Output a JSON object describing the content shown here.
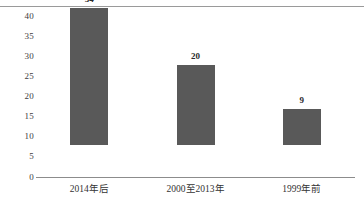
{
  "chart_data": {
    "type": "bar",
    "title": "",
    "subtitle": "",
    "xlabel": "",
    "ylabel": "",
    "categories": [
      "2014年后",
      "2000至2013年",
      "1999年前"
    ],
    "values": [
      34,
      20,
      9
    ],
    "series": [
      {
        "name": "",
        "values": [
          34,
          20,
          9
        ]
      }
    ],
    "ylim": [
      0,
      40
    ],
    "yticks": [
      0,
      5,
      10,
      15,
      20,
      25,
      30,
      35,
      40
    ],
    "ytick_labels": [
      "0",
      "5",
      "10",
      "15",
      "20",
      "25",
      "30",
      "35",
      "40"
    ],
    "grid": false,
    "legend": false,
    "legend_position": "none",
    "data_labels": [
      "34",
      "20",
      "9"
    ],
    "bar_color": "#595959",
    "axis_color": "#8c8c8c",
    "background_color": "#ffffff",
    "text_color": "#333333"
  }
}
